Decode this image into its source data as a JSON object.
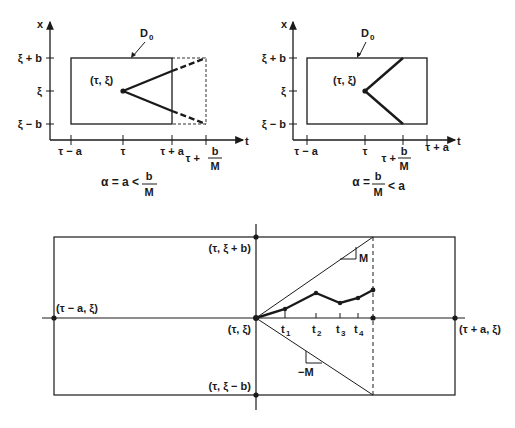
{
  "figure_left": {
    "x_axis_label": "x",
    "t_axis_label": "t",
    "region_label": "D",
    "region_sub": "0",
    "y_ticks": [
      "ξ + b",
      "ξ",
      "ξ − b"
    ],
    "t_ticks": [
      "τ − a",
      "τ",
      "τ + a"
    ],
    "t_tick_frac_prefix": "τ +",
    "frac_num": "b",
    "frac_den": "M",
    "point_label": "(τ, ξ)",
    "caption_prefix": "α = a <",
    "caption_num": "b",
    "caption_den": "M"
  },
  "figure_right": {
    "x_axis_label": "x",
    "t_axis_label": "t",
    "region_label": "D",
    "region_sub": "0",
    "y_ticks": [
      "ξ + b",
      "ξ",
      "ξ − b"
    ],
    "t_ticks": [
      "τ − a",
      "τ",
      "τ + a"
    ],
    "t_tick_frac_prefix": "τ +",
    "frac_num": "b",
    "frac_den": "M",
    "point_label": "(τ, ξ)",
    "caption_prefix": "α =",
    "caption_num": "b",
    "caption_den": "M",
    "caption_suffix": "< a"
  },
  "figure_bottom": {
    "label_top": "(τ, ξ + b)",
    "label_left": "(τ − a, ξ)",
    "label_center": "(τ, ξ)",
    "label_bottom": "(τ, ξ − b)",
    "label_right": "(τ + a, ξ)",
    "slope_pos": "M",
    "slope_neg": "−M",
    "t_points": [
      "t",
      "t",
      "t",
      "t"
    ],
    "t_subs": [
      "1",
      "2",
      "3",
      "4"
    ]
  }
}
